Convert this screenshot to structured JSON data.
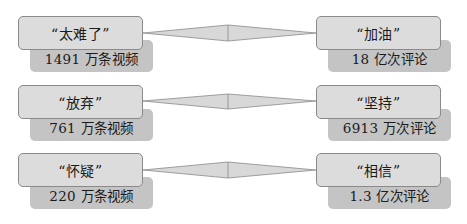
{
  "colors": {
    "main_fill": "#dcdcdc",
    "main_border": "#8a8a8a",
    "sub_fill": "#c4c4c4",
    "connector_fill": "#d8d8d8",
    "connector_stroke": "#8a8a8a",
    "text": "#1a1a1a"
  },
  "rows": [
    {
      "left": {
        "label": "“太难了”",
        "stat": "1491 万条视频"
      },
      "right": {
        "label": "“加油”",
        "stat": "18 亿次评论"
      }
    },
    {
      "left": {
        "label": "“放弃”",
        "stat": "761 万条视频"
      },
      "right": {
        "label": "“坚持”",
        "stat": "6913 万次评论"
      }
    },
    {
      "left": {
        "label": "“怀疑”",
        "stat": "220 万条视频"
      },
      "right": {
        "label": "“相信”",
        "stat": "1.3 亿次评论"
      }
    }
  ]
}
